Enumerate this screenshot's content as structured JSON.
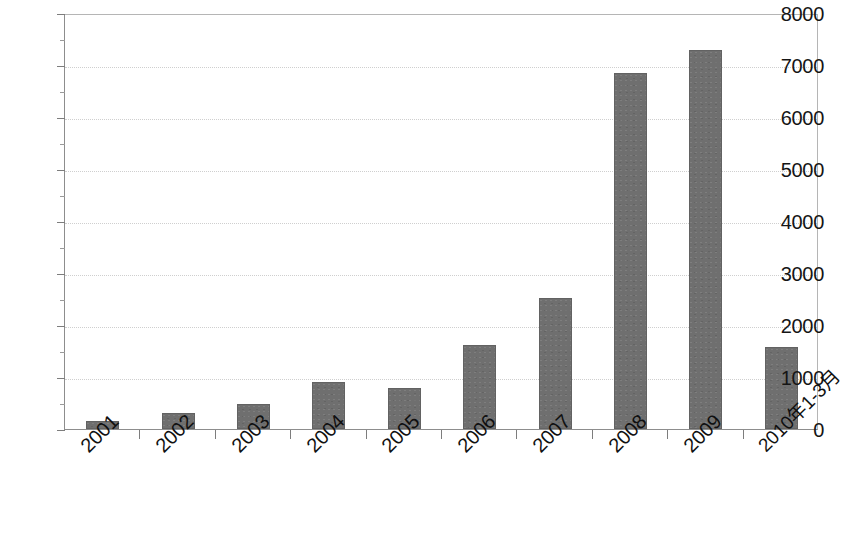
{
  "chart_data": {
    "type": "bar",
    "title": "",
    "subtitle": "",
    "xlabel": "",
    "ylabel": "",
    "categories": [
      "2001",
      "2002",
      "2003",
      "2004",
      "2005",
      "2006",
      "2007",
      "2008",
      "2009",
      "2010年1-3月"
    ],
    "values": [
      150,
      300,
      480,
      900,
      780,
      1620,
      2510,
      6850,
      7280,
      1580
    ],
    "series": [
      {
        "name": "",
        "values": [
          150,
          300,
          480,
          900,
          780,
          1620,
          2510,
          6850,
          7280,
          1580
        ]
      }
    ],
    "ylim": [
      0,
      8000
    ],
    "ytick_values": [
      0,
      1000,
      2000,
      3000,
      4000,
      5000,
      6000,
      7000,
      8000
    ],
    "ytick_labels": [
      "0",
      "1000",
      "2000",
      "3000",
      "4000",
      "5000",
      "6000",
      "7000",
      "8000"
    ],
    "grid": true,
    "grid_axis": "y",
    "legend": false,
    "legend_position": "none",
    "bar_color": "#6f6f6f",
    "plot_background": "#ffffff",
    "axis_color": "#7d7d7d",
    "grid_color": "#cfcfcf",
    "xtick_rotation": -45,
    "annotations": []
  }
}
